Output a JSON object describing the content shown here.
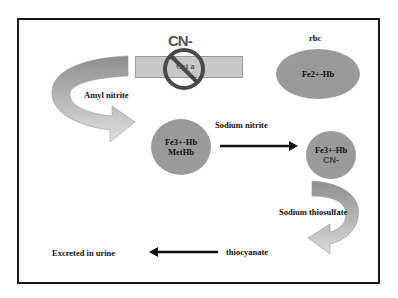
{
  "diagram": {
    "type": "cyanide-poisoning-antidote-pathway",
    "membrane_label": "Cyt a",
    "blocked_ion": "CN-",
    "rbc_label": "rbc",
    "nodes": {
      "fe2_hb": {
        "label": "Fe2+-Hb"
      },
      "fe3_hb": {
        "line1": "Fe3+-Hb",
        "line2": "MetHb"
      },
      "fe3_hb_cn": {
        "line1": "Fe3+-Hb",
        "line2": "CN-"
      }
    },
    "edges": {
      "amyl_nitrite": "Amyl nitrite",
      "sodium_nitrite": "Sodium nitrite",
      "sodium_thiosulfate": "Sodium thiosulfate",
      "thiocyanate": "thiocyanate",
      "excreted": "Excreted in urine"
    },
    "colors": {
      "circle_fill": "#9a9a9a",
      "bar_fill": "#c8c8c8",
      "frame": "#1a1a1a",
      "prohibit": "#4a4a4a"
    }
  }
}
